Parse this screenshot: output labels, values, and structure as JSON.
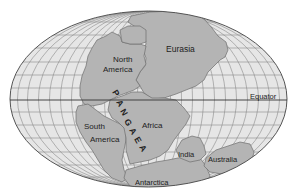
{
  "map": {
    "title": "Pangaea",
    "projection": "elliptical (Mollweide-like)",
    "colors": {
      "background": "#ffffff",
      "ocean": "#e6e6e6",
      "land": "#b4b4b4",
      "land_stroke": "#6e6e6e",
      "graticule": "#8a8a8a",
      "equator": "#333333",
      "text": "#222222"
    },
    "labels": {
      "supercontinent": "PANGAEA",
      "supercontinent_letters": [
        "P",
        "A",
        "N",
        "G",
        "A",
        "E",
        "A"
      ],
      "eurasia": "Eurasia",
      "north_america_line1": "North",
      "north_america_line2": "America",
      "south_america_line1": "South",
      "south_america_line2": "America",
      "africa": "Africa",
      "india": "India",
      "australia": "Australia",
      "antarctica": "Antarctica",
      "equator": "Equator"
    }
  }
}
